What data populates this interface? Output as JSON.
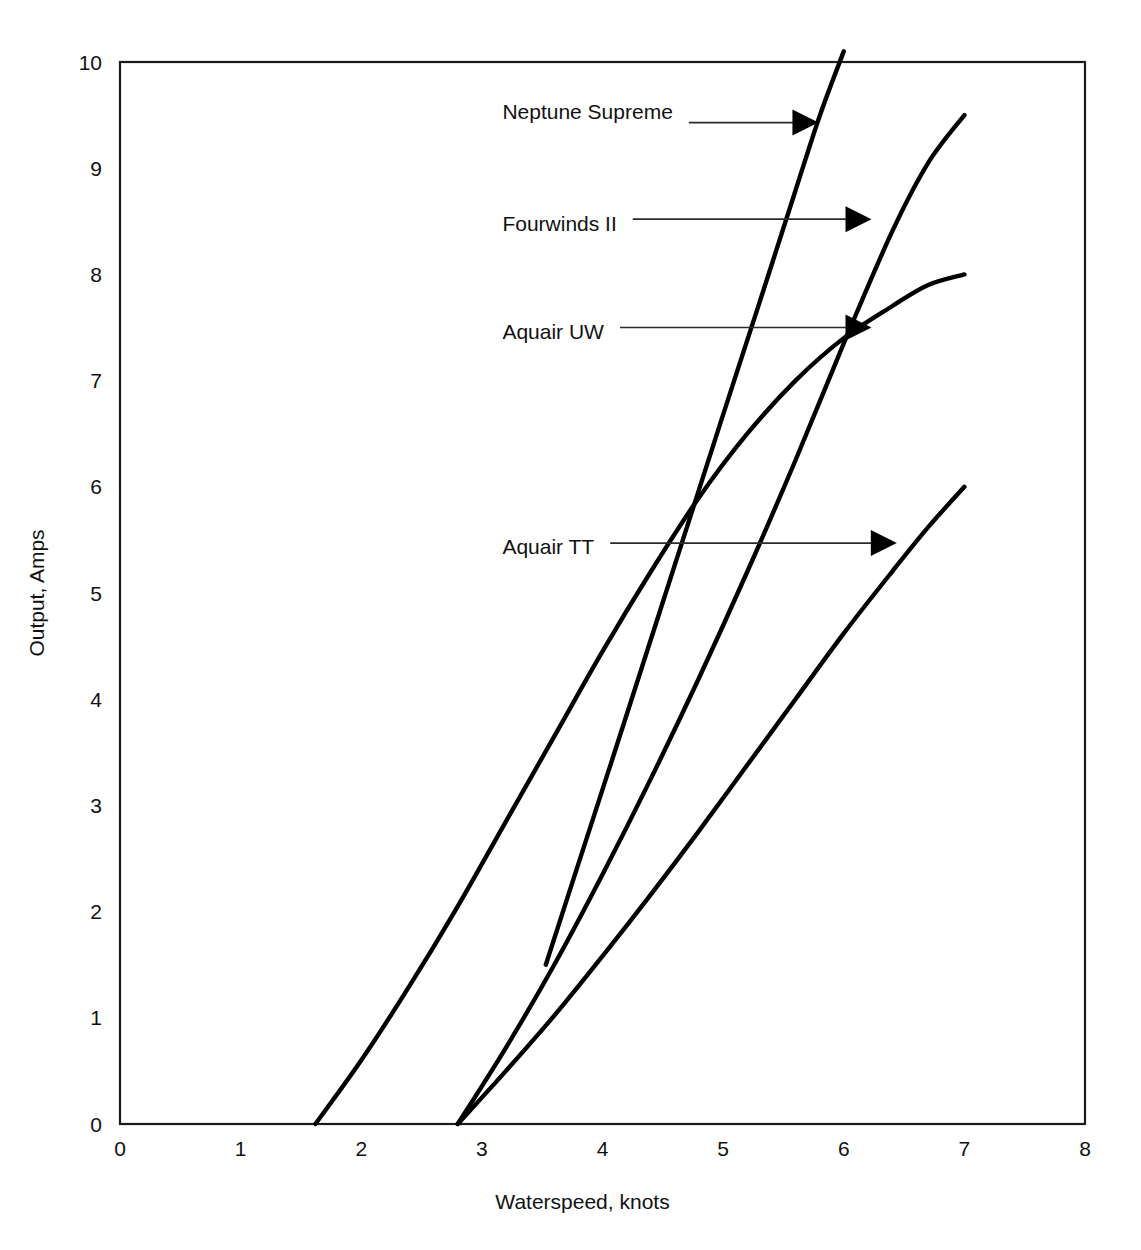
{
  "chart_data": {
    "type": "line",
    "title": "",
    "xlabel": "Waterspeed, knots",
    "ylabel": "Output, Amps",
    "xlim": [
      0,
      8
    ],
    "ylim": [
      0,
      10
    ],
    "xticks": [
      "0",
      "1",
      "2",
      "3",
      "4",
      "5",
      "6",
      "7",
      "8"
    ],
    "yticks": [
      "0",
      "1",
      "2",
      "3",
      "4",
      "5",
      "6",
      "7",
      "8",
      "9",
      "10"
    ],
    "grid": false,
    "legend_position": "inline-annotations",
    "line_color": "#000000",
    "frame_color": "#1a1a1a",
    "series": [
      {
        "name": "Neptune Supreme",
        "x": [
          3.53,
          3.8,
          4.1,
          4.4,
          4.7,
          5.0,
          5.3,
          5.6,
          5.8,
          6.0
        ],
        "y": [
          1.5,
          2.45,
          3.5,
          4.56,
          5.62,
          6.68,
          7.73,
          8.79,
          9.49,
          10.1
        ]
      },
      {
        "name": "Fourwinds II",
        "x": [
          2.8,
          3.2,
          3.6,
          4.0,
          4.4,
          4.8,
          5.2,
          5.6,
          6.0,
          6.4,
          6.7,
          7.0
        ],
        "y": [
          0.0,
          0.72,
          1.5,
          2.35,
          3.25,
          4.2,
          5.2,
          6.25,
          7.35,
          8.4,
          9.05,
          9.5
        ]
      },
      {
        "name": "Aquair UW",
        "x": [
          1.62,
          2.0,
          2.4,
          2.8,
          3.2,
          3.6,
          4.0,
          4.4,
          4.8,
          5.2,
          5.6,
          6.0,
          6.4,
          6.7,
          7.0
        ],
        "y": [
          0.0,
          0.6,
          1.3,
          2.05,
          2.85,
          3.65,
          4.45,
          5.2,
          5.9,
          6.5,
          7.0,
          7.4,
          7.7,
          7.9,
          8.0
        ]
      },
      {
        "name": "Aquair TT",
        "x": [
          2.8,
          3.2,
          3.6,
          4.0,
          4.4,
          4.8,
          5.2,
          5.6,
          6.0,
          6.4,
          6.7,
          7.0
        ],
        "y": [
          0.0,
          0.5,
          1.02,
          1.58,
          2.16,
          2.76,
          3.38,
          4.0,
          4.62,
          5.2,
          5.62,
          6.0
        ]
      }
    ],
    "annotations": [
      {
        "text": "Neptune Supreme",
        "label_x": 3.17,
        "label_y": 9.53,
        "arrow_tip_x": 5.79,
        "arrow_tip_y": 9.43
      },
      {
        "text": "Fourwinds II",
        "label_x": 3.17,
        "label_y": 8.48,
        "arrow_tip_x": 6.23,
        "arrow_tip_y": 8.52
      },
      {
        "text": "Aquair UW",
        "label_x": 3.17,
        "label_y": 7.46,
        "arrow_tip_x": 6.23,
        "arrow_tip_y": 7.5
      },
      {
        "text": "Aquair TT",
        "label_x": 3.17,
        "label_y": 5.44,
        "arrow_tip_x": 6.44,
        "arrow_tip_y": 5.47
      }
    ]
  }
}
